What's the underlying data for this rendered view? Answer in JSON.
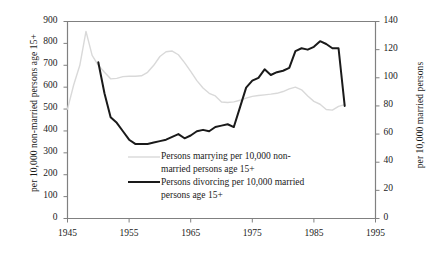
{
  "chart_data": {
    "type": "line",
    "title": "",
    "xlabel": "",
    "ylabel": "per 10,000 non-married persons age 15+",
    "ylabel_right": "per 10,000 married persons",
    "xlim": [
      1945,
      1995
    ],
    "ylim": [
      0,
      900
    ],
    "ylim_right": [
      0,
      140
    ],
    "xticks": [
      1945,
      1955,
      1965,
      1975,
      1985,
      1995
    ],
    "yticks": [
      0,
      100,
      200,
      300,
      400,
      500,
      600,
      700,
      800,
      900
    ],
    "yticks_right": [
      0,
      20,
      40,
      60,
      80,
      100,
      120,
      140
    ],
    "grid": false,
    "legend_position": "center",
    "series": [
      {
        "name": "Persons marrying per 10,000 non-married persons age 15+",
        "axis": "left",
        "color": "#d9d9d9",
        "width": 1.4,
        "x": [
          1945,
          1946,
          1947,
          1948,
          1949,
          1950,
          1951,
          1952,
          1953,
          1954,
          1955,
          1956,
          1957,
          1958,
          1959,
          1960,
          1961,
          1962,
          1963,
          1964,
          1965,
          1966,
          1967,
          1968,
          1969,
          1970,
          1971,
          1972,
          1973,
          1974,
          1975,
          1976,
          1977,
          1978,
          1979,
          1980,
          1981,
          1982,
          1983,
          1984,
          1985,
          1986,
          1987,
          1988,
          1989,
          1990
        ],
        "values": [
          500,
          610,
          700,
          855,
          745,
          700,
          668,
          638,
          640,
          648,
          650,
          650,
          652,
          668,
          700,
          740,
          762,
          765,
          748,
          712,
          672,
          630,
          596,
          572,
          560,
          532,
          530,
          533,
          540,
          550,
          558,
          562,
          565,
          568,
          572,
          580,
          592,
          600,
          588,
          560,
          535,
          522,
          498,
          495,
          512,
          520
        ]
      },
      {
        "name": "Persons divorcing per 10,000 married persons age 15+",
        "axis": "right",
        "color": "#1a1a1a",
        "width": 2.0,
        "x": [
          1950,
          1951,
          1952,
          1953,
          1954,
          1955,
          1956,
          1957,
          1958,
          1959,
          1960,
          1961,
          1962,
          1963,
          1964,
          1965,
          1966,
          1967,
          1968,
          1969,
          1970,
          1971,
          1972,
          1973,
          1974,
          1975,
          1976,
          1977,
          1978,
          1979,
          1980,
          1981,
          1982,
          1983,
          1984,
          1985,
          1986,
          1987,
          1988,
          1989,
          1990
        ],
        "values": [
          111,
          89,
          72,
          68,
          62,
          56,
          53,
          53,
          53,
          54,
          55,
          56,
          58,
          60,
          57,
          59,
          62,
          63,
          62,
          65,
          66,
          67,
          65,
          79,
          93,
          98,
          100,
          106,
          102,
          104,
          105,
          107,
          119,
          121,
          120,
          122,
          126,
          124,
          121,
          121,
          80
        ]
      }
    ]
  },
  "legend": {
    "entries": [
      {
        "line1": "Persons marrying per 10,000 non-",
        "line2": "married persons age 15+",
        "swatch": "marry-line-swatch"
      },
      {
        "line1": "Persons divorcing per 10,000 married",
        "line2": "persons age 15+",
        "swatch": "divorce-line-swatch"
      }
    ]
  },
  "axes": {
    "left_title": "per 10,000 non-married persons age 15+",
    "right_title": "per 10,000 married persons",
    "y_left": [
      "900",
      "800",
      "700",
      "600",
      "500",
      "400",
      "300",
      "200",
      "100",
      "0"
    ],
    "y_right": [
      "140",
      "120",
      "100",
      "80",
      "60",
      "40",
      "20",
      "0"
    ],
    "x": [
      "1945",
      "1955",
      "1965",
      "1975",
      "1985",
      "1995"
    ]
  },
  "colors": {
    "marry_line": "#d9d9d9",
    "divorce_line": "#1a1a1a",
    "frame": "#808080",
    "text": "#1a1a1a"
  }
}
